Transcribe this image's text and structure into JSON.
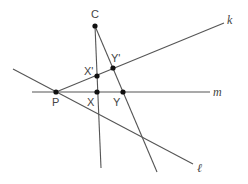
{
  "diagram": {
    "type": "geometry-construction",
    "points": {
      "C": {
        "label": "C",
        "x": 95,
        "y": 26
      },
      "P": {
        "label": "P",
        "x": 56,
        "y": 92
      },
      "X": {
        "label": "X",
        "x": 97,
        "y": 92
      },
      "Y": {
        "label": "Y",
        "x": 123,
        "y": 92
      },
      "Xp": {
        "label": "X'",
        "x": 97,
        "y": 76
      },
      "Yp": {
        "label": "Y'",
        "x": 113,
        "y": 68
      }
    },
    "lines": {
      "k": {
        "label": "k"
      },
      "m": {
        "label": "m"
      },
      "l": {
        "label": "ℓ"
      }
    }
  }
}
